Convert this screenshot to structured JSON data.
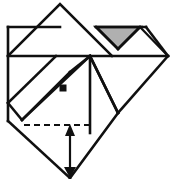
{
  "figure": {
    "type": "origami-fold-diagram",
    "canvas": {
      "width": 172,
      "height": 179
    },
    "colors": {
      "line": "#101010",
      "shaded_fill": "#b0b0b0",
      "background": "#ffffff"
    },
    "shaded_face": {
      "name": "shaded-triangle",
      "fill": "#b0b0b0",
      "points": "96,27 140,27 118,49"
    },
    "outline_paths": [
      {
        "name": "top-left-roof-edge",
        "d": "M 8 56 L 60 4 L 112 56"
      },
      {
        "name": "left-vertical-edge",
        "d": "M 8 27 L 8 121"
      },
      {
        "name": "top-left-horizontal-edge",
        "d": "M 8 27 L 60 27"
      },
      {
        "name": "main-horizontal-fold",
        "d": "M 8 56 L 168 56"
      },
      {
        "name": "upper-right-horizontal-edge",
        "d": "M 96 27 L 146 27"
      },
      {
        "name": "right-upper-diagonal",
        "d": "M 146 27 L 168 56"
      },
      {
        "name": "right-lower-diagonal",
        "d": "M 168 56 L 118 113"
      },
      {
        "name": "shaded-tri-left-diagonal",
        "d": "M 96 27 L 118 49"
      },
      {
        "name": "shaded-tri-right-diagonal",
        "d": "M 140 27 L 118 49"
      },
      {
        "name": "right-of-shaded-diagonal",
        "d": "M 140 27 L 168 56"
      },
      {
        "name": "center-vertical-fold",
        "d": "M 90 56 L 90 133"
      },
      {
        "name": "center-to-lowerright-diagonal",
        "d": "M 90 56 L 118 113"
      },
      {
        "name": "lower-right-outer-diagonal",
        "d": "M 118 113 L 90 56"
      },
      {
        "name": "inner-diamond-upper-left",
        "d": "M 22 120 L 90 56"
      },
      {
        "name": "inner-diamond-left-edge",
        "d": "M 8 103 L 22 120"
      },
      {
        "name": "outer-diamond-left-lower",
        "d": "M 8 121 L 70 178"
      },
      {
        "name": "outer-diamond-right-lower",
        "d": "M 118 113 L 70 178"
      },
      {
        "name": "mid-left-diagonal",
        "d": "M 22 120 L 70 72"
      },
      {
        "name": "mid-diagonal-to-center",
        "d": "M 70 72 L 90 56"
      },
      {
        "name": "left-fold-diagonal",
        "d": "M 8 103 L 56 56"
      }
    ],
    "dashed_paths": [
      {
        "name": "horizontal-fold-guide",
        "d": "M 24 125 L 92 125"
      }
    ],
    "arrow": {
      "name": "fold-direction-arrow",
      "direction": "up",
      "shaft": "M 70 172 L 70 130",
      "head_points": "70 124 65 136 75 136",
      "tail_points": "70 178 64 167 76 167"
    },
    "markers": [
      {
        "name": "corner-point-marker",
        "x": 63,
        "y": 88,
        "size": 7
      }
    ]
  }
}
